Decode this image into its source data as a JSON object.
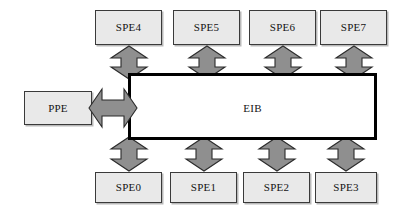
{
  "diagram": {
    "bus": {
      "id": "eib",
      "label": "EIB",
      "fill_color": "#ffffff",
      "border_color": "#000000"
    },
    "processor": {
      "id": "ppe",
      "label": "PPE",
      "fill_color": "#e9e9e9",
      "border_color": "#3a3a3a"
    },
    "spes_top": [
      {
        "id": "spe4",
        "label": "SPE4"
      },
      {
        "id": "spe5",
        "label": "SPE5"
      },
      {
        "id": "spe6",
        "label": "SPE6"
      },
      {
        "id": "spe7",
        "label": "SPE7"
      }
    ],
    "spes_bottom": [
      {
        "id": "spe0",
        "label": "SPE0"
      },
      {
        "id": "spe1",
        "label": "SPE1"
      },
      {
        "id": "spe2",
        "label": "SPE2"
      },
      {
        "id": "spe3",
        "label": "SPE3"
      }
    ],
    "connectors": {
      "fill_color": "#8f8f8f",
      "border_color": "#2b2b2b",
      "vertical_top": [
        "spe4-eib-link",
        "spe5-eib-link",
        "spe6-eib-link",
        "spe7-eib-link"
      ],
      "vertical_bottom": [
        "spe0-eib-link",
        "spe1-eib-link",
        "spe2-eib-link",
        "spe3-eib-link"
      ],
      "horizontal": [
        "ppe-eib-link"
      ]
    }
  }
}
